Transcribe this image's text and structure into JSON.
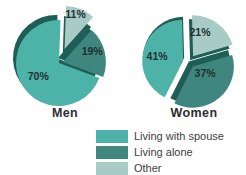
{
  "chart_data": {
    "type": "pie",
    "title": "",
    "unit": "%",
    "legend_position": "bottom-center",
    "categories": [
      "Living with spouse",
      "Living alone",
      "Other"
    ],
    "series": [
      {
        "name": "Men",
        "values": [
          70,
          19,
          11
        ]
      },
      {
        "name": "Women",
        "values": [
          41,
          37,
          21
        ]
      }
    ],
    "label_color": "#22302e",
    "wall_color": "#1f5e57",
    "background_color": "#ffffff",
    "legend": [
      {
        "key": "spouse",
        "label": "Living with spouse",
        "color": "#4db2a8"
      },
      {
        "key": "alone",
        "label": "Living alone",
        "color": "#3e867e"
      },
      {
        "key": "other",
        "label": "Other",
        "color": "#a8cbc5"
      }
    ],
    "pies": [
      {
        "title": "Men",
        "cx": 59,
        "cy": 63,
        "r": 43,
        "slices": [
          {
            "key": "spouse",
            "pct": 70,
            "start": 110.4,
            "end": 362,
            "explode": 0,
            "wall": [
              -3,
              -5
            ],
            "label_angle": 236,
            "label_r": 0.58
          },
          {
            "key": "alone",
            "pct": 19,
            "start": 42,
            "end": 110.4,
            "explode": 4,
            "wall": [
              -5,
              -4
            ],
            "label_angle": 71,
            "label_r": 0.72
          },
          {
            "key": "other",
            "pct": 11,
            "start": 2,
            "end": 41.6,
            "explode": 15,
            "wall": [
              -2,
              10
            ],
            "label_angle": 18,
            "label_r": 0.82
          }
        ]
      },
      {
        "title": "Women",
        "cx": 63,
        "cy": 62,
        "r": 41,
        "slices": [
          {
            "key": "spouse",
            "pct": 41,
            "start": 206.8,
            "end": 358.4,
            "explode": 6,
            "wall": [
              1,
              -3
            ],
            "label_angle": 277,
            "label_r": 0.64
          },
          {
            "key": "alone",
            "pct": 37,
            "start": 73.6,
            "end": 206.8,
            "explode": 6,
            "wall": [
              -4,
              -5
            ],
            "label_angle": 121,
            "label_r": 0.35
          },
          {
            "key": "other",
            "pct": 21,
            "start": 358.4,
            "end": 433.6,
            "explode": 7,
            "wall": [
              -3,
              4
            ],
            "label_angle": 16.5,
            "label_r": 0.59
          }
        ]
      }
    ]
  }
}
